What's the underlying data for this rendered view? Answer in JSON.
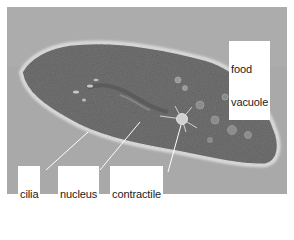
{
  "figure": {
    "colors": {
      "background": "#a8a8a8",
      "cell_body": "#6e6e6e",
      "cell_halo": "#d4d4d4",
      "label_bg": "#ffffff",
      "label_text": "#1a1a1a",
      "pointer": "#ffffff",
      "border": "#ffffff"
    },
    "labels": [
      {
        "id": "food-vacuole",
        "lines": [
          "food",
          "vacuole"
        ]
      },
      {
        "id": "cilia",
        "lines": [
          "cilia"
        ]
      },
      {
        "id": "nucleus",
        "lines": [
          "nucleus"
        ]
      },
      {
        "id": "contractile-vacuole",
        "lines": [
          "contractile",
          "vacuole"
        ]
      }
    ]
  }
}
